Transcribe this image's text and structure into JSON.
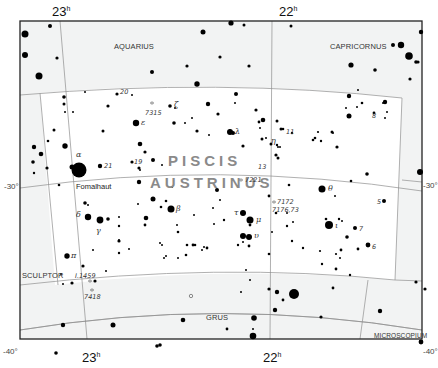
{
  "map": {
    "title": "Piscis Austrinus",
    "main_constellation": {
      "line1": "PISCIS",
      "line2": "AUSTRINUS"
    },
    "neighbor_constellations": [
      "AQUARIUS",
      "CAPRICORNUS",
      "SCULPTOR",
      "GRUS",
      "MICROSCOPIUM"
    ],
    "ra_labels": {
      "top_left": "23",
      "top_right": "22",
      "bottom_left": "23",
      "bottom_right": "22",
      "unit": "h"
    },
    "dec_labels": {
      "left_30": "-30°",
      "right_30": "-30°",
      "left_40": "-40°",
      "right_40": "-40°"
    },
    "star_names": {
      "fomalhaut": "Fomalhaut"
    },
    "greek_labels": {
      "alpha": "α",
      "beta": "β",
      "gamma": "γ",
      "delta": "δ",
      "epsilon": "ε",
      "zeta": "ζ",
      "eta": "η",
      "theta": "θ",
      "iota": "ι",
      "lambda": "λ",
      "mu": "μ",
      "pi": "π",
      "tau": "τ",
      "upsilon": "υ"
    },
    "flamsteed_labels": {
      "n20": "20",
      "n21": "21",
      "n19": "19",
      "n11": "11",
      "n13": "13",
      "n5": "5",
      "n7": "7",
      "n6": "6",
      "n8": "8"
    },
    "deep_sky_labels": {
      "ngc7315": "7315",
      "ngc7221": "7221",
      "ngc7172": "7172",
      "ngc7176": "7176,73",
      "ic1459": "I.1459",
      "ngc7418": "7418"
    },
    "colors": {
      "background": "#ffffff",
      "outside_fill": "#f3f4f4",
      "border_line": "#9a9a9a",
      "frame": "#222222",
      "star": "#000000",
      "main_label": "#8a8a8a"
    }
  }
}
